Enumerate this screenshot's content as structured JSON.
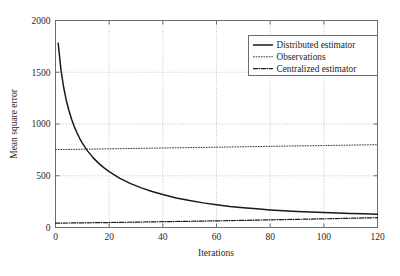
{
  "chart_data": {
    "type": "line",
    "title": "",
    "xlabel": "Iterations",
    "ylabel": "Mean square error",
    "xlim": [
      0,
      120
    ],
    "ylim": [
      0,
      2000
    ],
    "xticks": [
      0,
      20,
      40,
      60,
      80,
      100,
      120
    ],
    "yticks": [
      0,
      500,
      1000,
      1500,
      2000
    ],
    "xtick_labels": [
      "0",
      "20",
      "40",
      "60",
      "80",
      "100",
      "120"
    ],
    "ytick_labels": [
      "0",
      "500",
      "1000",
      "1500",
      "2000"
    ],
    "grid": true,
    "grid_style": "dotted",
    "legend_position": "upper right",
    "series": [
      {
        "name": "Distributed estimator",
        "style": "solid",
        "color": "#1a1a1a",
        "x": [
          1,
          2,
          3,
          4,
          5,
          6,
          7,
          8,
          9,
          10,
          12,
          14,
          16,
          18,
          20,
          24,
          28,
          32,
          36,
          40,
          45,
          50,
          55,
          60,
          65,
          70,
          75,
          80,
          85,
          90,
          95,
          100,
          105,
          110,
          115,
          120
        ],
        "y": [
          1780,
          1530,
          1360,
          1230,
          1130,
          1045,
          975,
          915,
          862,
          815,
          738,
          675,
          622,
          578,
          540,
          475,
          424,
          383,
          348,
          318,
          286,
          260,
          238,
          220,
          204,
          191,
          180,
          170,
          162,
          155,
          149,
          144,
          139,
          135,
          132,
          129
        ]
      },
      {
        "name": "Observations",
        "style": "dotted",
        "color": "#3d3a3b",
        "x": [
          0,
          20,
          40,
          60,
          80,
          100,
          120
        ],
        "y": [
          752,
          760,
          768,
          776,
          784,
          792,
          800
        ]
      },
      {
        "name": "Centralized estimator",
        "style": "dashdot",
        "color": "#1a1a1a",
        "x": [
          0,
          20,
          40,
          60,
          80,
          100,
          120
        ],
        "y": [
          42,
          48,
          56,
          64,
          74,
          84,
          95
        ]
      }
    ]
  },
  "legend": {
    "entries": [
      {
        "label": "Distributed estimator",
        "style": "solid"
      },
      {
        "label": "Observations",
        "style": "dotted"
      },
      {
        "label": "Centralized estimator",
        "style": "dashdot"
      }
    ]
  },
  "axes": {
    "x_title": "Iterations",
    "y_title": "Mean square error"
  }
}
